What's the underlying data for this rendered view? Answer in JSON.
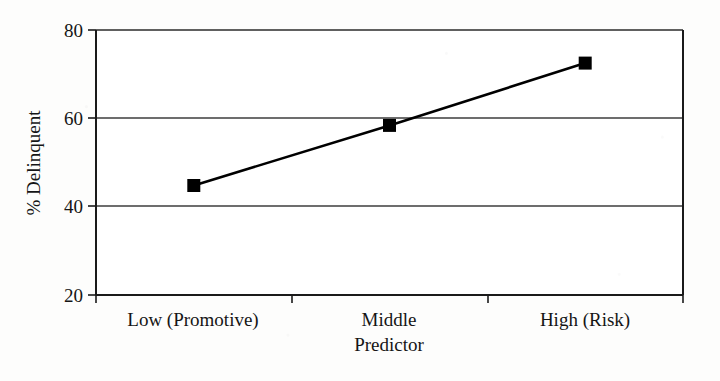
{
  "chart_data": {
    "type": "line",
    "title": "",
    "subtitle": "",
    "xlabel": "Predictor",
    "ylabel": "% Delinquent",
    "categories": [
      "Low (Promotive)",
      "Middle",
      "High (Risk)"
    ],
    "values": [
      44.8,
      58.4,
      72.5
    ],
    "series": [
      {
        "name": "% Delinquent",
        "values": [
          44.8,
          58.4,
          72.5
        ],
        "marker": "filled-square",
        "marker_color": "#000000",
        "line_color": "#000000"
      }
    ],
    "ylim": [
      20,
      80
    ],
    "yticks": [
      20,
      40,
      60,
      80
    ],
    "ytick_labels": [
      "20",
      "40",
      "60",
      "80"
    ],
    "grid": "horizontal",
    "legend": "none",
    "annotations": []
  },
  "axes": {
    "y_tick_0": "20",
    "y_tick_1": "40",
    "y_tick_2": "60",
    "y_tick_3": "80",
    "y_title": "% Delinquent",
    "x_tick_0": "Low (Promotive)",
    "x_tick_1": "Middle",
    "x_tick_2": "High (Risk)",
    "x_title": "Predictor"
  },
  "colors": {
    "line": "#000000",
    "marker": "#000000",
    "axis": "#1a1a1a",
    "grid": "#4a4a4a",
    "background": "#fdfdfc"
  }
}
